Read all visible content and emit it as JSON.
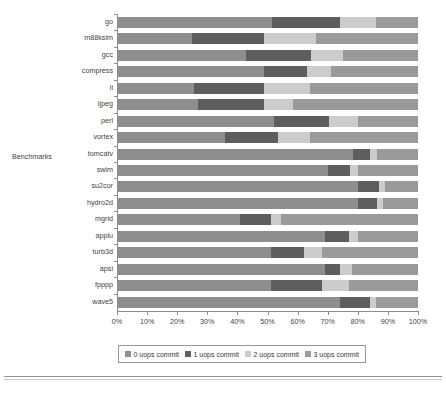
{
  "chart_data": {
    "type": "bar",
    "orientation": "horizontal",
    "stacked": true,
    "normalized_percent": true,
    "title": "",
    "xlabel": "",
    "ylabel": "Benchmarks",
    "xlim": [
      0,
      100
    ],
    "grid": false,
    "legend_position": "bottom",
    "xtick_labels": [
      "0%",
      "10%",
      "20%",
      "30%",
      "40%",
      "50%",
      "60%",
      "70%",
      "80%",
      "90%",
      "100%"
    ],
    "xtick_values": [
      0,
      10,
      20,
      30,
      40,
      50,
      60,
      70,
      80,
      90,
      100
    ],
    "categories": [
      "go",
      "m88ksim",
      "gcc",
      "compress",
      "li",
      "ijpeg",
      "perl",
      "vortex",
      "tomcatv",
      "swim",
      "su2cor",
      "hydro2d",
      "mgrid",
      "applu",
      "turb3d",
      "apsi",
      "fpppp",
      "wave5"
    ],
    "series": [
      {
        "name": "0 uops commit",
        "color": "#8e8e8e",
        "values": [
          51.6,
          25.0,
          43.0,
          49.0,
          25.5,
          27.0,
          52.0,
          36.0,
          78.5,
          70.0,
          80.0,
          80.0,
          41.0,
          69.0,
          51.0,
          69.0,
          51.0,
          74.0
        ]
      },
      {
        "name": "1 uops commit",
        "color": "#5e5e5e",
        "values": [
          22.4,
          24.0,
          21.5,
          14.0,
          23.5,
          22.0,
          18.5,
          17.5,
          5.5,
          7.5,
          7.0,
          6.5,
          10.0,
          8.0,
          11.0,
          5.0,
          17.0,
          10.0
        ]
      },
      {
        "name": "2 uops commit",
        "color": "#cccccc",
        "values": [
          12.0,
          17.0,
          10.5,
          8.0,
          15.0,
          9.5,
          9.5,
          10.5,
          2.5,
          2.5,
          2.0,
          2.0,
          3.5,
          3.0,
          6.0,
          4.0,
          9.0,
          2.0
        ]
      },
      {
        "name": "3 uops commit",
        "color": "#9a9a9a",
        "values": [
          14.0,
          34.0,
          25.0,
          29.0,
          36.0,
          41.5,
          20.0,
          36.0,
          13.5,
          20.0,
          11.0,
          11.5,
          45.5,
          20.0,
          32.0,
          22.0,
          23.0,
          14.0
        ]
      }
    ]
  },
  "legend": {
    "items": [
      {
        "label": "0 uops commit",
        "color": "#8e8e8e"
      },
      {
        "label": "1 uops commit",
        "color": "#5e5e5e"
      },
      {
        "label": "2 uops commit",
        "color": "#cccccc"
      },
      {
        "label": "3 uops commit",
        "color": "#9a9a9a"
      }
    ]
  },
  "axis": {
    "y_title": "Benchmarks"
  }
}
